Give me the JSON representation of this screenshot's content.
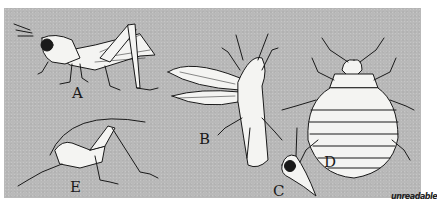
{
  "figure": {
    "panel_color": "#b9b9b9",
    "background_color": "#ffffff",
    "line_color": "#1a1a1a",
    "fill_color": "#f4f4f2"
  },
  "labels": {
    "a": "A",
    "b": "B",
    "c": "C",
    "d": "D",
    "e": "E"
  },
  "signature": {
    "text": "unreadable"
  }
}
